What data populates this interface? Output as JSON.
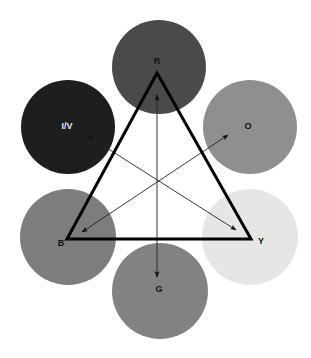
{
  "diagram": {
    "circles": [
      {
        "id": "red",
        "label": "R",
        "cx": 159,
        "cy": 67,
        "r": 47,
        "fill": "#4a4a4a",
        "label_color": "#111111",
        "label_x": 157,
        "label_y": 62
      },
      {
        "id": "orange",
        "label": "O",
        "cx": 250,
        "cy": 127,
        "r": 47,
        "fill": "#8f8f8f",
        "label_color": "#111111",
        "label_x": 248,
        "label_y": 127
      },
      {
        "id": "yellow",
        "label": "Y",
        "cx": 250,
        "cy": 237,
        "r": 48,
        "fill": "#e6e6e6",
        "label_color": "#111111",
        "label_x": 261,
        "label_y": 242
      },
      {
        "id": "green",
        "label": "G",
        "cx": 160,
        "cy": 291,
        "r": 48,
        "fill": "#828282",
        "label_color": "#111111",
        "label_x": 159,
        "label_y": 290
      },
      {
        "id": "blue",
        "label": "B",
        "cx": 68,
        "cy": 237,
        "r": 48,
        "fill": "#7d7d7d",
        "label_color": "#111111",
        "label_x": 61,
        "label_y": 244
      },
      {
        "id": "indigo-violet",
        "label": "I/V",
        "cx": 68,
        "cy": 127,
        "r": 47,
        "fill": "#1e1e1e",
        "label_color": "#e6e6e6",
        "label_x": 67,
        "label_y": 127
      }
    ],
    "triangle": {
      "points": "157,73 251,239 67,239",
      "stroke": "#000000",
      "stroke_width": 3
    },
    "arrows": [
      {
        "id": "y-to-iv",
        "x1": 236,
        "y1": 230,
        "x2": 88,
        "y2": 136
      },
      {
        "id": "b-to-o",
        "x1": 82,
        "y1": 232,
        "x2": 228,
        "y2": 135
      },
      {
        "id": "r-to-g",
        "x1": 157,
        "y1": 95,
        "x2": 157,
        "y2": 277
      }
    ]
  }
}
